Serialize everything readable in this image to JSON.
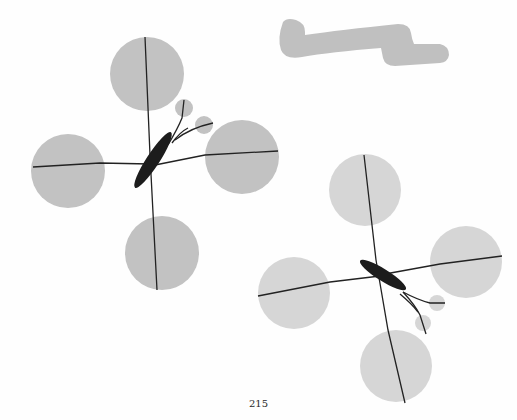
{
  "page": {
    "page_number": "215"
  },
  "illustration": {
    "description": "Two water striders (insects) standing on water, with gray circles showing surface dimples under each leg, plus a gray squiggle shape",
    "colors": {
      "dimple_dark": "#c2c2c2",
      "dimple_light": "#d6d6d6",
      "squiggle": "#c0c0c0",
      "insect_body": "#1c1c1c",
      "legs": "#222222"
    }
  }
}
